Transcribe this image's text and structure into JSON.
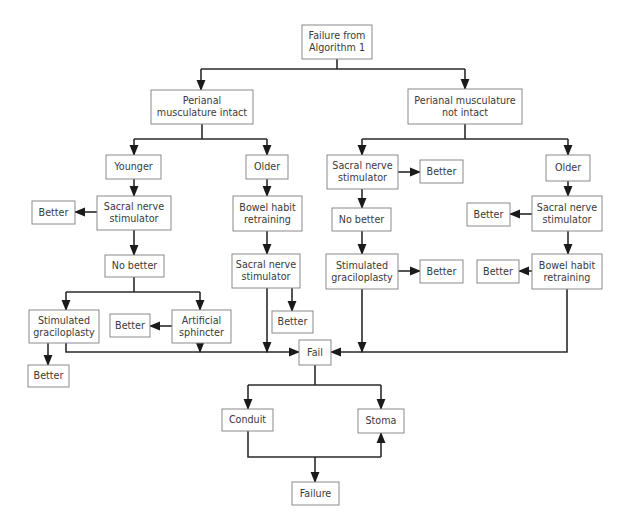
{
  "nodes": [
    {
      "id": "start",
      "lines": [
        "Failure from",
        "Algorithm 1"
      ]
    },
    {
      "id": "pm_intact",
      "lines": [
        "Perianal",
        "musculature intact"
      ]
    },
    {
      "id": "pm_not_intact",
      "lines": [
        "Perianal musculature",
        "not intact"
      ]
    },
    {
      "id": "younger",
      "lines": [
        "Younger"
      ]
    },
    {
      "id": "older_l",
      "lines": [
        "Older"
      ]
    },
    {
      "id": "sns_l1",
      "lines": [
        "Sacral nerve",
        "stimulator"
      ]
    },
    {
      "id": "better_l1",
      "lines": [
        "Better"
      ]
    },
    {
      "id": "bht_l",
      "lines": [
        "Bowel habit",
        "retraining"
      ]
    },
    {
      "id": "nobetter_l",
      "lines": [
        "No better"
      ]
    },
    {
      "id": "sns_l2",
      "lines": [
        "Sacral nerve",
        "stimulator"
      ]
    },
    {
      "id": "grac_l",
      "lines": [
        "Stimulated",
        "graciloplasty"
      ]
    },
    {
      "id": "better_art",
      "lines": [
        "Better"
      ]
    },
    {
      "id": "art_sph",
      "lines": [
        "Artificial",
        "sphincter"
      ]
    },
    {
      "id": "better_sns_l2",
      "lines": [
        "Better"
      ]
    },
    {
      "id": "better_grac_l",
      "lines": [
        "Better"
      ]
    },
    {
      "id": "fail",
      "lines": [
        "Fail"
      ]
    },
    {
      "id": "sns_r1",
      "lines": [
        "Sacral nerve",
        "stimulator"
      ]
    },
    {
      "id": "better_r1",
      "lines": [
        "Better"
      ]
    },
    {
      "id": "nobetter_r",
      "lines": [
        "No better"
      ]
    },
    {
      "id": "grac_r",
      "lines": [
        "Stimulated",
        "graciloplasty"
      ]
    },
    {
      "id": "better_grac_r",
      "lines": [
        "Better"
      ]
    },
    {
      "id": "older_r",
      "lines": [
        "Older"
      ]
    },
    {
      "id": "sns_r2",
      "lines": [
        "Sacral nerve",
        "stimulator"
      ]
    },
    {
      "id": "better_sns_r2",
      "lines": [
        "Better"
      ]
    },
    {
      "id": "bht_r",
      "lines": [
        "Bowel habit",
        "retraining"
      ]
    },
    {
      "id": "better_bht_r",
      "lines": [
        "Better"
      ]
    },
    {
      "id": "conduit",
      "lines": [
        "Conduit"
      ]
    },
    {
      "id": "stoma",
      "lines": [
        "Stoma"
      ]
    },
    {
      "id": "failure",
      "lines": [
        "Failure"
      ]
    }
  ],
  "edges": [
    {
      "from": "start",
      "to": "pm_intact"
    },
    {
      "from": "start",
      "to": "pm_not_intact"
    },
    {
      "from": "pm_intact",
      "to": "younger"
    },
    {
      "from": "pm_intact",
      "to": "older_l"
    },
    {
      "from": "younger",
      "to": "sns_l1"
    },
    {
      "from": "sns_l1",
      "to": "better_l1"
    },
    {
      "from": "sns_l1",
      "to": "nobetter_l"
    },
    {
      "from": "nobetter_l",
      "to": "grac_l"
    },
    {
      "from": "nobetter_l",
      "to": "art_sph"
    },
    {
      "from": "grac_l",
      "to": "better_grac_l"
    },
    {
      "from": "grac_l",
      "to": "fail"
    },
    {
      "from": "art_sph",
      "to": "better_art"
    },
    {
      "from": "art_sph",
      "to": "fail"
    },
    {
      "from": "older_l",
      "to": "bht_l"
    },
    {
      "from": "bht_l",
      "to": "sns_l2"
    },
    {
      "from": "sns_l2",
      "to": "better_sns_l2"
    },
    {
      "from": "sns_l2",
      "to": "fail"
    },
    {
      "from": "pm_not_intact",
      "to": "sns_r1"
    },
    {
      "from": "pm_not_intact",
      "to": "older_r"
    },
    {
      "from": "sns_r1",
      "to": "better_r1"
    },
    {
      "from": "sns_r1",
      "to": "nobetter_r"
    },
    {
      "from": "nobetter_r",
      "to": "grac_r"
    },
    {
      "from": "grac_r",
      "to": "better_grac_r"
    },
    {
      "from": "grac_r",
      "to": "fail"
    },
    {
      "from": "older_r",
      "to": "sns_r2"
    },
    {
      "from": "sns_r2",
      "to": "better_sns_r2"
    },
    {
      "from": "sns_r2",
      "to": "bht_r"
    },
    {
      "from": "bht_r",
      "to": "better_bht_r"
    },
    {
      "from": "bht_r",
      "to": "fail"
    },
    {
      "from": "fail",
      "to": "conduit"
    },
    {
      "from": "fail",
      "to": "stoma"
    },
    {
      "from": "conduit",
      "to": "failure"
    },
    {
      "from": "conduit",
      "to": "stoma"
    }
  ]
}
